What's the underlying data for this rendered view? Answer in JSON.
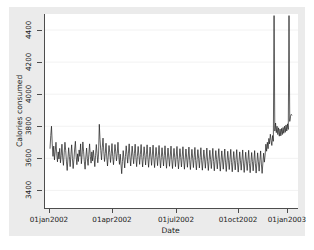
{
  "chart_data": {
    "type": "line",
    "title": "",
    "xlabel": "Date",
    "ylabel": "Calories consumed",
    "grid": true,
    "legend": null,
    "ylim": [
      3290,
      4500
    ],
    "yticks": [
      3400,
      3600,
      3800,
      4000,
      4200,
      4400
    ],
    "ytick_labels": [
      "3400",
      "3600",
      "3800",
      "4000",
      "4200",
      "4400"
    ],
    "xlim": [
      "01jan2002",
      "15jan2003"
    ],
    "xticks": [
      "01jan2002",
      "01apr2002",
      "01jul2002",
      "01oct2002",
      "01jan2003"
    ],
    "xtick_labels": [
      "01jan2002",
      "01apr2002",
      "01jul2002",
      "01oct2002",
      "01jan2003"
    ],
    "series": [
      {
        "name": "Calories consumed",
        "color": "#1a1a1a",
        "x_start": "01jan2002",
        "x_unit": "day",
        "note": "daily calories; two clipped vertical spikes near late-Nov 2002 and late-Dec 2002 exceed the 4500 top of the plot",
        "values": [
          3660,
          3742,
          3800,
          3690,
          3612,
          3676,
          3590,
          3645,
          3700,
          3628,
          3578,
          3640,
          3596,
          3662,
          3572,
          3618,
          3688,
          3602,
          3556,
          3634,
          3700,
          3648,
          3582,
          3524,
          3596,
          3666,
          3610,
          3548,
          3622,
          3684,
          3600,
          3536,
          3592,
          3658,
          3706,
          3614,
          3560,
          3628,
          3580,
          3652,
          3612,
          3690,
          3566,
          3624,
          3702,
          3640,
          3578,
          3532,
          3608,
          3664,
          3598,
          3556,
          3626,
          3690,
          3612,
          3570,
          3640,
          3584,
          3650,
          3604,
          3548,
          3616,
          3686,
          3630,
          3572,
          3626,
          3812,
          3716,
          3648,
          3590,
          3668,
          3726,
          3644,
          3580,
          3630,
          3694,
          3608,
          3552,
          3614,
          3680,
          3636,
          3574,
          3628,
          3692,
          3610,
          3560,
          3622,
          3686,
          3640,
          3584,
          3630,
          3700,
          3618,
          3562,
          3626,
          3566,
          3504,
          3580,
          3648,
          3596,
          3540,
          3612,
          3678,
          3624,
          3570,
          3632,
          3690,
          3608,
          3552,
          3614,
          3676,
          3620,
          3566,
          3628,
          3688,
          3606,
          3548,
          3612,
          3674,
          3618,
          3562,
          3624,
          3686,
          3604,
          3546,
          3610,
          3672,
          3616,
          3558,
          3622,
          3684,
          3602,
          3544,
          3608,
          3670,
          3614,
          3556,
          3620,
          3682,
          3600,
          3542,
          3606,
          3668,
          3612,
          3554,
          3618,
          3680,
          3598,
          3540,
          3604,
          3666,
          3610,
          3552,
          3616,
          3678,
          3596,
          3538,
          3602,
          3664,
          3608,
          3550,
          3614,
          3676,
          3594,
          3536,
          3600,
          3662,
          3606,
          3548,
          3612,
          3674,
          3592,
          3534,
          3598,
          3660,
          3604,
          3546,
          3610,
          3672,
          3590,
          3532,
          3596,
          3658,
          3602,
          3544,
          3608,
          3670,
          3588,
          3530,
          3594,
          3656,
          3600,
          3542,
          3606,
          3668,
          3586,
          3528,
          3592,
          3654,
          3598,
          3540,
          3604,
          3666,
          3584,
          3526,
          3590,
          3652,
          3596,
          3538,
          3602,
          3664,
          3582,
          3524,
          3588,
          3650,
          3594,
          3536,
          3600,
          3662,
          3580,
          3522,
          3586,
          3648,
          3592,
          3534,
          3598,
          3660,
          3578,
          3520,
          3584,
          3646,
          3590,
          3532,
          3596,
          3658,
          3576,
          3518,
          3582,
          3644,
          3588,
          3530,
          3594,
          3656,
          3574,
          3516,
          3580,
          3642,
          3586,
          3528,
          3592,
          3654,
          3572,
          3514,
          3578,
          3640,
          3584,
          3526,
          3590,
          3652,
          3570,
          3512,
          3576,
          3638,
          3582,
          3524,
          3588,
          3650,
          3568,
          3510,
          3574,
          3636,
          3580,
          3522,
          3586,
          3648,
          3566,
          3508,
          3572,
          3634,
          3578,
          3520,
          3584,
          3646,
          3564,
          3506,
          3570,
          3632,
          3576,
          3620,
          3688,
          3644,
          3700,
          3660,
          3724,
          3690,
          3750,
          3712,
          3680,
          3742,
          3706,
          4490,
          3770,
          3820,
          3760,
          3800,
          3748,
          3790,
          3738,
          3782,
          3740,
          3786,
          3748,
          3792,
          3756,
          3800,
          3762,
          3808,
          3770,
          3815,
          3780,
          4490,
          3830,
          3862,
          3874,
          3868
        ]
      }
    ],
    "spikes": [
      {
        "x_index": 330,
        "label": "clipped spike 1"
      },
      {
        "x_index": 362,
        "label": "clipped spike 2"
      }
    ]
  }
}
